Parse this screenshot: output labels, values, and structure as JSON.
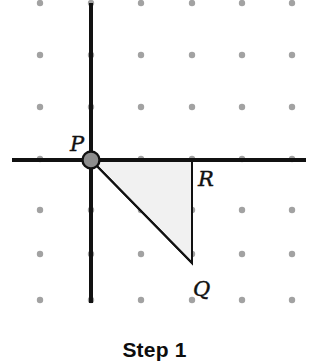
{
  "figure": {
    "caption": "Step 1",
    "width": 309,
    "height": 362,
    "background_color": "#ffffff"
  },
  "colors": {
    "axis": "#111111",
    "grid_dot": "#a2a2a2",
    "triangle_fill": "#f1f1f1",
    "triangle_stroke": "#111111",
    "origin_point_fill": "#8d8d8d",
    "origin_point_stroke": "#111111",
    "label_text": "#111111",
    "caption_text": "#0d0d0d"
  },
  "axes": {
    "x_axis": {
      "name": "x-axis",
      "y": 160,
      "x_start": 12,
      "x_end": 306,
      "thickness": 4
    },
    "y_axis": {
      "name": "y-axis",
      "x": 91,
      "y_start": 3,
      "y_end": 303,
      "thickness": 4
    }
  },
  "grid": {
    "columns_x": [
      40,
      91,
      141,
      192,
      242,
      292
    ],
    "rows_y": [
      3,
      55,
      107,
      159,
      210,
      254,
      300
    ],
    "dot_radius": 3.2
  },
  "points": [
    {
      "label": "P",
      "x": 91,
      "y": 159,
      "label_x": 70,
      "label_y": 151,
      "marked": true
    },
    {
      "label": "R",
      "x": 192,
      "y": 160,
      "label_x": 198,
      "label_y": 186,
      "marked": false
    },
    {
      "label": "Q",
      "x": 192,
      "y": 263,
      "label_x": 193,
      "label_y": 296,
      "marked": false
    }
  ],
  "triangle": {
    "name": "triangle-PQR",
    "vertices": "91,160 192,160 192,263",
    "fill": "#f1f1f1",
    "stroke": "#111111",
    "stroke_width": 2
  },
  "origin_marker": {
    "cx": 91,
    "cy": 160,
    "r": 8.5,
    "stroke_width": 2.4
  }
}
